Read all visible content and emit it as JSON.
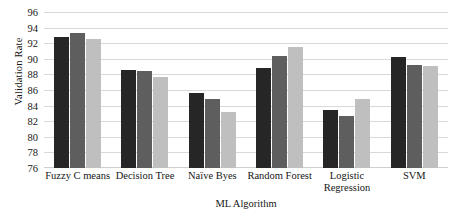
{
  "chart_data": {
    "type": "bar",
    "title": "",
    "xlabel": "ML Algorithm",
    "ylabel": "Validation Rate",
    "ylim": [
      76,
      96
    ],
    "ytick_step": 2,
    "yticks": [
      96,
      94,
      92,
      90,
      88,
      86,
      84,
      82,
      80,
      78,
      76
    ],
    "grid": true,
    "legend": "none",
    "categories": [
      "Fuzzy C means",
      "Decision Tree",
      "Naïve Byes",
      "Random Forest",
      "Logistic Regression",
      "SVM"
    ],
    "category_lines": [
      [
        "Fuzzy C means",
        ""
      ],
      [
        "Decision Tree",
        ""
      ],
      [
        "Naïve Byes",
        ""
      ],
      [
        "Random Forest",
        ""
      ],
      [
        "Logistic",
        "Regression"
      ],
      [
        "SVM",
        ""
      ]
    ],
    "series": [
      {
        "name": "series-1",
        "color": "#262626",
        "values": [
          92.8,
          88.6,
          85.6,
          88.8,
          83.4,
          90.2
        ]
      },
      {
        "name": "series-2",
        "color": "#5e5e5e",
        "values": [
          93.3,
          88.4,
          84.8,
          90.3,
          82.7,
          89.2
        ]
      },
      {
        "name": "series-3",
        "color": "#bfbfbf",
        "values": [
          92.6,
          87.7,
          83.2,
          91.5,
          84.9,
          89.1
        ]
      }
    ]
  }
}
